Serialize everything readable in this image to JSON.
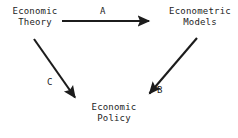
{
  "diagram": {
    "background_color": "#ffffff",
    "stroke_color": "#1c1c1c",
    "text_color": "#242424",
    "nodes": [
      {
        "id": "economic-theory",
        "line1": "Economic",
        "line2": "Theory"
      },
      {
        "id": "econometric-models",
        "line1": "Econometric",
        "line2": "Models"
      },
      {
        "id": "economic-policy",
        "line1": "Economic",
        "line2": "Policy"
      }
    ],
    "edges": [
      {
        "id": "edge-a",
        "label": "A",
        "from": "economic-theory",
        "to": "econometric-models"
      },
      {
        "id": "edge-b",
        "label": "B",
        "from": "econometric-models",
        "to": "economic-policy"
      },
      {
        "id": "edge-c",
        "label": "C",
        "from": "economic-theory",
        "to": "economic-policy"
      }
    ]
  }
}
